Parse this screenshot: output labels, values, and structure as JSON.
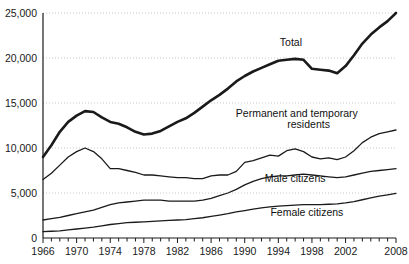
{
  "chart_data": {
    "type": "line",
    "title": "",
    "xlabel": "",
    "ylabel": "",
    "grid": true,
    "legend_position": "inline-annotations",
    "xlim": [
      1966,
      2008
    ],
    "ylim": [
      0,
      25000
    ],
    "y_ticks": [
      0,
      5000,
      10000,
      15000,
      20000,
      25000
    ],
    "y_tick_labels": [
      "0",
      "5,000",
      "10,000",
      "15,000",
      "20,000",
      "25,000"
    ],
    "x_ticks_minor_step": 1,
    "x_tick_labels": [
      "1966",
      "1970",
      "1974",
      "1978",
      "1982",
      "1986",
      "1990",
      "1994",
      "1998",
      "2002",
      "2008"
    ],
    "x_tick_label_years": [
      1966,
      1970,
      1974,
      1978,
      1982,
      1986,
      1990,
      1994,
      1998,
      2002,
      2008
    ],
    "x": [
      1966,
      1967,
      1968,
      1969,
      1970,
      1971,
      1972,
      1973,
      1974,
      1975,
      1976,
      1977,
      1978,
      1979,
      1980,
      1981,
      1982,
      1983,
      1984,
      1985,
      1986,
      1987,
      1988,
      1989,
      1990,
      1991,
      1992,
      1993,
      1994,
      1995,
      1996,
      1997,
      1998,
      1999,
      2000,
      2001,
      2002,
      2003,
      2004,
      2005,
      2006,
      2007,
      2008
    ],
    "series": [
      {
        "name": "Total",
        "style": "thick",
        "values": [
          9000,
          10300,
          11800,
          12900,
          13600,
          14100,
          14000,
          13400,
          12900,
          12700,
          12300,
          11800,
          11500,
          11600,
          11900,
          12400,
          12900,
          13300,
          13900,
          14600,
          15300,
          15900,
          16600,
          17400,
          18000,
          18500,
          18900,
          19300,
          19700,
          19800,
          19900,
          19800,
          18800,
          18700,
          18600,
          18300,
          19100,
          20300,
          21600,
          22600,
          23400,
          24100,
          25000
        ]
      },
      {
        "name": "Permanent and temporary residents",
        "style": "thin",
        "values": [
          6500,
          7200,
          8100,
          9000,
          9600,
          10000,
          9600,
          8800,
          7700,
          7700,
          7500,
          7300,
          7000,
          7000,
          6900,
          6800,
          6700,
          6700,
          6600,
          6600,
          6900,
          7000,
          7000,
          7400,
          8400,
          8600,
          8900,
          9200,
          9100,
          9700,
          9900,
          9600,
          9000,
          8800,
          8900,
          8700,
          9000,
          9700,
          10600,
          11200,
          11600,
          11800,
          12000
        ]
      },
      {
        "name": "Male citizens",
        "style": "thin",
        "values": [
          2000,
          2150,
          2300,
          2500,
          2700,
          2900,
          3100,
          3400,
          3700,
          3900,
          4000,
          4100,
          4200,
          4200,
          4200,
          4100,
          4100,
          4100,
          4100,
          4200,
          4400,
          4700,
          5000,
          5400,
          5900,
          6300,
          6600,
          6800,
          6900,
          6900,
          7000,
          7100,
          7000,
          6900,
          6800,
          6700,
          6800,
          7000,
          7200,
          7400,
          7500,
          7600,
          7700
        ]
      },
      {
        "name": "Female citizens",
        "style": "thin",
        "values": [
          700,
          750,
          800,
          900,
          1000,
          1100,
          1200,
          1350,
          1500,
          1600,
          1700,
          1750,
          1800,
          1850,
          1900,
          1950,
          2000,
          2050,
          2150,
          2250,
          2400,
          2550,
          2700,
          2900,
          3050,
          3200,
          3350,
          3450,
          3550,
          3600,
          3650,
          3700,
          3700,
          3700,
          3750,
          3800,
          3900,
          4050,
          4250,
          4450,
          4650,
          4800,
          4950
        ]
      }
    ],
    "annotations": [
      {
        "text": "Total",
        "series": "Total",
        "x": 1995.5,
        "y": 21300
      },
      {
        "text": "Permanent and temporary",
        "series": "Permanent and temporary residents",
        "x": 1996.2,
        "y": 13400
      },
      {
        "text": "residents",
        "series": "Permanent and temporary residents",
        "x": 1997.6,
        "y": 12250
      },
      {
        "text": "Male citizens",
        "series": "Male citizens",
        "x": 1996.0,
        "y": 6200
      },
      {
        "text": "Female citizens",
        "series": "Female citizens",
        "x": 1997.4,
        "y": 2500
      }
    ],
    "colors": {
      "line": "#1a1a1a",
      "grid": "#c9c9c9",
      "background": "#ffffff"
    }
  }
}
